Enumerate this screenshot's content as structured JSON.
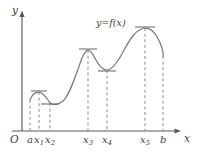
{
  "figure": {
    "title_label": "y=f(x)",
    "axes": {
      "x_axis_label": "x",
      "y_axis_label": "y",
      "origin_label": "O"
    },
    "tick_labels": [
      {
        "id": "a",
        "base": "a",
        "sub": "",
        "x": 30
      },
      {
        "id": "x1",
        "base": "x",
        "sub": "1",
        "x": 39
      },
      {
        "id": "x2",
        "base": "x",
        "sub": "2",
        "x": 50
      },
      {
        "id": "x3",
        "base": "x",
        "sub": "3",
        "x": 88
      },
      {
        "id": "x4",
        "base": "x",
        "sub": "4",
        "x": 107
      },
      {
        "id": "x5",
        "base": "x",
        "sub": "5",
        "x": 145
      },
      {
        "id": "b",
        "base": "b",
        "sub": "",
        "x": 163
      }
    ],
    "colors": {
      "curve": "#7b7b7b",
      "axis": "#5a5a5a",
      "dashed": "#8d8d8d",
      "tangent": "#6f6f6f",
      "text": "#3d3d3d",
      "background": "#ffffff"
    }
  },
  "chart_data": {
    "type": "line",
    "title": "y=f(x)",
    "xlabel": "x",
    "ylabel": "y",
    "grid": false,
    "legend": "none",
    "annotations": [
      "y=f(x)"
    ],
    "xlim": [
      22,
      180
    ],
    "ylim": [
      131,
      12
    ],
    "x_ticks": [
      "a",
      "x1",
      "x2",
      "x3",
      "x4",
      "x5",
      "b"
    ],
    "x_tick_pixels": [
      30,
      39,
      50,
      88,
      107,
      145,
      163
    ],
    "critical_points": [
      {
        "label": "a",
        "x": 30,
        "y": 100,
        "kind": "endpoint",
        "tangent_mark": false
      },
      {
        "label": "x1",
        "x": 39,
        "y": 92,
        "kind": "local-max",
        "tangent_mark": true
      },
      {
        "label": "x2",
        "x": 50,
        "y": 103,
        "kind": "local-min",
        "tangent_mark": true
      },
      {
        "label": "x3",
        "x": 88,
        "y": 50,
        "kind": "local-max",
        "tangent_mark": true
      },
      {
        "label": "x4",
        "x": 107,
        "y": 70,
        "kind": "local-min",
        "tangent_mark": true
      },
      {
        "label": "x5",
        "x": 145,
        "y": 28,
        "kind": "local-max",
        "tangent_mark": true
      },
      {
        "label": "b",
        "x": 163,
        "y": 56,
        "kind": "endpoint",
        "tangent_mark": false
      }
    ],
    "curve_path": "M30,100 C31.5,95.5 34.5,92 39,92 C43.5,92 46.5,98.5 50,102.8 C53.5,105.5 58,105 63,101 C70,95 76,74 82,58 C84.5,52.5 86,50 88,50 C90.5,50 93,54 96,60 C99.5,66.5 102.5,70 107,70 C112,70 117,63 123,52 C130,39 136,29 145,28 C152,28 158,36 162,48 C163,52 163.3,54 163.3,56",
    "dashed_verticals": [
      {
        "label": "a",
        "x": 30,
        "y_top": 100,
        "y_bottom": 131
      },
      {
        "label": "x1",
        "x": 39,
        "y_top": 92,
        "y_bottom": 131
      },
      {
        "label": "x2",
        "x": 50,
        "y_top": 103,
        "y_bottom": 131
      },
      {
        "label": "x3",
        "x": 88,
        "y_top": 50,
        "y_bottom": 131
      },
      {
        "label": "x4",
        "x": 107,
        "y_top": 70,
        "y_bottom": 131
      },
      {
        "label": "x5",
        "x": 145,
        "y_top": 28,
        "y_bottom": 131
      },
      {
        "label": "b",
        "x": 163,
        "y_top": 56,
        "y_bottom": 131
      }
    ],
    "tangent_marks": [
      {
        "label": "x1",
        "x": 39,
        "y": 91,
        "half_width": 8
      },
      {
        "label": "x2",
        "x": 50,
        "y": 104,
        "half_width": 9
      },
      {
        "label": "x3",
        "x": 88,
        "y": 49,
        "half_width": 9
      },
      {
        "label": "x4",
        "x": 107,
        "y": 71,
        "half_width": 9
      },
      {
        "label": "x5",
        "x": 145,
        "y": 27,
        "half_width": 10
      }
    ]
  }
}
